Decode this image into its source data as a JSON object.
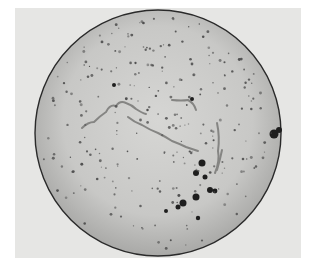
{
  "image": {
    "subject": "circular microscope field of view (photomicrograph)",
    "background_color": "#e6e6e4",
    "field_color": "#c9c9c7",
    "edge_color": "#2a2a2a",
    "filament_color": "#8a8a88",
    "speck_color": "#4a4a4a"
  }
}
